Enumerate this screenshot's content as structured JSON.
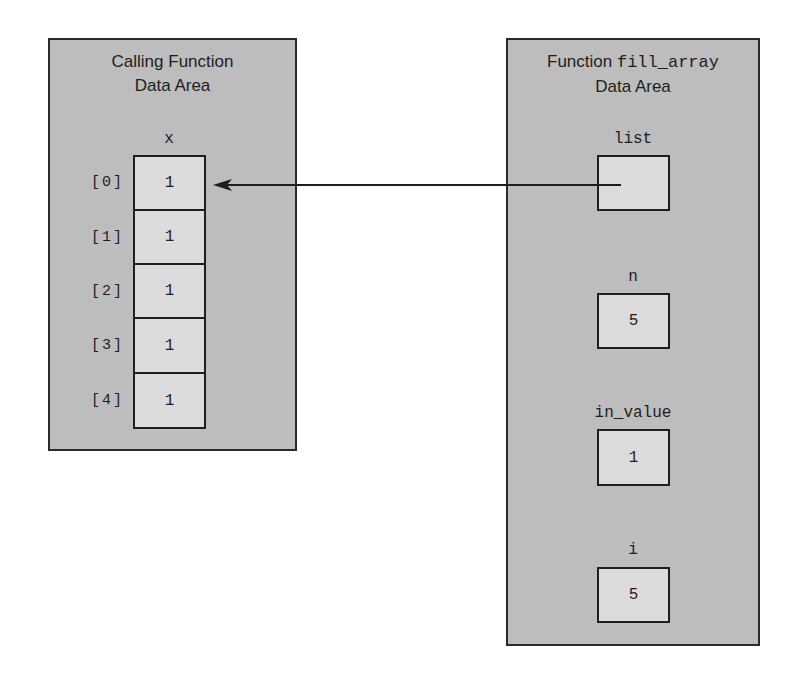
{
  "calling_panel": {
    "title_line1": "Calling Function",
    "title_line2": "Data Area",
    "array": {
      "name": "x",
      "cells": [
        {
          "index": "[0]",
          "value": "1"
        },
        {
          "index": "[1]",
          "value": "1"
        },
        {
          "index": "[2]",
          "value": "1"
        },
        {
          "index": "[3]",
          "value": "1"
        },
        {
          "index": "[4]",
          "value": "1"
        }
      ]
    }
  },
  "function_panel": {
    "title_prefix": "Function ",
    "function_name": "fill_array",
    "title_line2": "Data Area",
    "variables": [
      {
        "name": "list",
        "value": ""
      },
      {
        "name": "n",
        "value": "5"
      },
      {
        "name": "in_value",
        "value": "1"
      },
      {
        "name": "i",
        "value": "5"
      }
    ]
  },
  "arrow": {
    "from": "list",
    "to": "x[0]",
    "meaning": "pointer-reference"
  },
  "colors": {
    "panel_fill": "#bdbdbd",
    "cell_fill": "#dcdcdc",
    "stroke": "#1e1e1e"
  }
}
